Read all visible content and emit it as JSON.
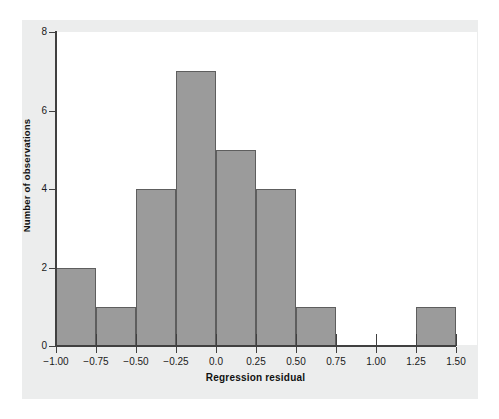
{
  "figure": {
    "top_caption": "",
    "background_color": "#eceded",
    "plot_background_color": "#ffffff",
    "bar_fill_color": "#9b9b9b",
    "bar_edge_color": "#5e5e5e",
    "axis_color": "#404040"
  },
  "chart_data": {
    "type": "bar",
    "title": "",
    "xlabel": "Regression residual",
    "ylabel": "Number of observations",
    "xlim": [
      -1.0,
      1.5
    ],
    "ylim": [
      0,
      8
    ],
    "grid": false,
    "legend": null,
    "bin_width": 0.25,
    "bin_edges": [
      -1.0,
      -0.75,
      -0.5,
      -0.25,
      0.0,
      0.25,
      0.5,
      0.75,
      1.0,
      1.25,
      1.5
    ],
    "categories": [
      "-1.00 to -0.75",
      "-0.75 to -0.50",
      "-0.50 to -0.25",
      "-0.25 to 0.00",
      "0.00 to 0.25",
      "0.25 to 0.50",
      "0.50 to 0.75",
      "0.75 to 1.00",
      "1.00 to 1.25",
      "1.25 to 1.50"
    ],
    "values": [
      2,
      1,
      4,
      7,
      5,
      4,
      1,
      0,
      0,
      1
    ],
    "xticks": [
      -1.0,
      -0.75,
      -0.5,
      -0.25,
      0.0,
      0.25,
      0.5,
      0.75,
      1.0,
      1.25,
      1.5
    ],
    "xtick_labels": [
      "−1.00",
      "−0.75",
      "−0.50",
      "−0.25",
      "0.0",
      "0.25",
      "0.50",
      "0.75",
      "1.00",
      "1.25",
      "1.50"
    ],
    "yticks": [
      0,
      2,
      4,
      6,
      8
    ],
    "ytick_labels": [
      "0",
      "2",
      "4",
      "6",
      "8"
    ]
  }
}
